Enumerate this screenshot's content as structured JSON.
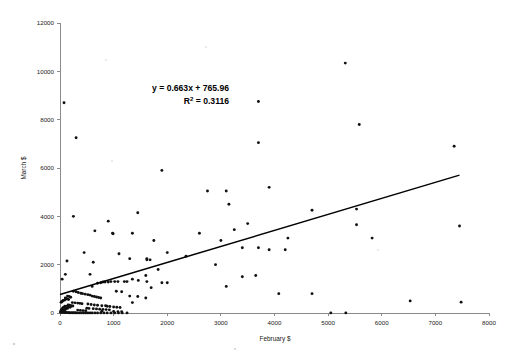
{
  "chart_data": {
    "type": "scatter",
    "title": "",
    "xlabel": "February $",
    "ylabel": "March $",
    "xlim": [
      0,
      8000
    ],
    "ylim": [
      0,
      12000
    ],
    "xticks": [
      0,
      1000,
      2000,
      3000,
      4000,
      5000,
      6000,
      7000,
      8000
    ],
    "yticks": [
      0,
      2000,
      4000,
      6000,
      8000,
      10000,
      12000
    ],
    "grid": false,
    "legend": "none",
    "marker": "small-black-dot",
    "annotations": [
      {
        "name": "regression-equation",
        "text": "y = 0.663x + 765.96"
      },
      {
        "name": "r-squared",
        "text_prefix": "R",
        "text_sup": "2",
        "text_suffix": " = 0.3116"
      }
    ],
    "trendline": {
      "type": "linear",
      "slope": 0.663,
      "intercept": 765.96,
      "r_squared": 0.3116,
      "x_start": 0,
      "x_end": 7450,
      "color": "#000000"
    },
    "series": [
      {
        "name": "Donors",
        "color": "#111111",
        "points": [
          [
            75,
            8700
          ],
          [
            300,
            7250
          ],
          [
            3700,
            8750
          ],
          [
            5320,
            10340
          ],
          [
            5580,
            7800
          ],
          [
            1900,
            5900
          ],
          [
            2750,
            5050
          ],
          [
            3100,
            5050
          ],
          [
            3700,
            7050
          ],
          [
            7350,
            6900
          ],
          [
            3900,
            5200
          ],
          [
            250,
            4000
          ],
          [
            1450,
            4150
          ],
          [
            900,
            3800
          ],
          [
            3150,
            4500
          ],
          [
            4700,
            4250
          ],
          [
            5530,
            4300
          ],
          [
            5530,
            3650
          ],
          [
            7450,
            3600
          ],
          [
            3500,
            3700
          ],
          [
            650,
            3400
          ],
          [
            980,
            3300
          ],
          [
            990,
            3280
          ],
          [
            1350,
            3300
          ],
          [
            1750,
            3000
          ],
          [
            2600,
            3300
          ],
          [
            3000,
            3000
          ],
          [
            4250,
            3100
          ],
          [
            3250,
            3450
          ],
          [
            5820,
            3100
          ],
          [
            3400,
            2700
          ],
          [
            3700,
            2700
          ],
          [
            3900,
            2620
          ],
          [
            4200,
            2620
          ],
          [
            450,
            2500
          ],
          [
            1100,
            2450
          ],
          [
            1300,
            2250
          ],
          [
            1620,
            2250
          ],
          [
            2000,
            2500
          ],
          [
            2350,
            2350
          ],
          [
            130,
            2150
          ],
          [
            620,
            2100
          ],
          [
            1620,
            2200
          ],
          [
            1680,
            2200
          ],
          [
            1830,
            1800
          ],
          [
            2900,
            2000
          ],
          [
            560,
            1600
          ],
          [
            100,
            1600
          ],
          [
            1600,
            1550
          ],
          [
            3400,
            1500
          ],
          [
            3650,
            1550
          ],
          [
            40,
            1400
          ],
          [
            1620,
            1300
          ],
          [
            1900,
            1250
          ],
          [
            2000,
            1250
          ],
          [
            3100,
            1100
          ],
          [
            1700,
            1050
          ],
          [
            1200,
            1300
          ],
          [
            1250,
            1300
          ],
          [
            1020,
            1300
          ],
          [
            1080,
            1300
          ],
          [
            900,
            1280
          ],
          [
            950,
            1300
          ],
          [
            800,
            1280
          ],
          [
            840,
            1280
          ],
          [
            760,
            1250
          ],
          [
            700,
            1230
          ],
          [
            600,
            1100
          ],
          [
            1600,
            620
          ],
          [
            1350,
            430
          ],
          [
            4080,
            800
          ],
          [
            4700,
            800
          ],
          [
            6530,
            500
          ],
          [
            7480,
            450
          ],
          [
            250,
            900
          ],
          [
            300,
            880
          ],
          [
            340,
            850
          ],
          [
            390,
            820
          ],
          [
            420,
            800
          ],
          [
            470,
            780
          ],
          [
            520,
            760
          ],
          [
            560,
            740
          ],
          [
            600,
            700
          ],
          [
            640,
            680
          ],
          [
            680,
            660
          ],
          [
            720,
            640
          ],
          [
            760,
            620
          ],
          [
            140,
            700
          ],
          [
            170,
            680
          ],
          [
            200,
            650
          ],
          [
            100,
            620
          ],
          [
            110,
            600
          ],
          [
            130,
            580
          ],
          [
            160,
            560
          ],
          [
            90,
            540
          ],
          [
            60,
            520
          ],
          [
            50,
            500
          ],
          [
            40,
            480
          ],
          [
            30,
            460
          ],
          [
            20,
            440
          ],
          [
            230,
            430
          ],
          [
            280,
            420
          ],
          [
            330,
            410
          ],
          [
            370,
            400
          ],
          [
            410,
            380
          ],
          [
            520,
            370
          ],
          [
            580,
            350
          ],
          [
            640,
            330
          ],
          [
            700,
            320
          ],
          [
            780,
            300
          ],
          [
            850,
            300
          ],
          [
            880,
            280
          ],
          [
            930,
            270
          ],
          [
            1000,
            250
          ],
          [
            1060,
            240
          ],
          [
            1120,
            230
          ],
          [
            620,
            180
          ],
          [
            680,
            170
          ],
          [
            740,
            160
          ],
          [
            800,
            150
          ],
          [
            860,
            140
          ],
          [
            920,
            130
          ],
          [
            330,
            120
          ],
          [
            380,
            110
          ],
          [
            430,
            100
          ],
          [
            480,
            90
          ],
          [
            150,
            330
          ],
          [
            180,
            320
          ],
          [
            210,
            300
          ],
          [
            240,
            290
          ],
          [
            90,
            280
          ],
          [
            110,
            270
          ],
          [
            130,
            260
          ],
          [
            160,
            250
          ],
          [
            190,
            240
          ],
          [
            60,
            230
          ],
          [
            80,
            220
          ],
          [
            100,
            210
          ],
          [
            120,
            200
          ],
          [
            140,
            190
          ],
          [
            40,
            180
          ],
          [
            55,
            170
          ],
          [
            70,
            160
          ],
          [
            85,
            150
          ],
          [
            100,
            140
          ],
          [
            25,
            130
          ],
          [
            35,
            120
          ],
          [
            45,
            110
          ],
          [
            55,
            100
          ],
          [
            65,
            90
          ],
          [
            15,
            80
          ],
          [
            25,
            70
          ],
          [
            35,
            60
          ],
          [
            45,
            50
          ],
          [
            55,
            40
          ],
          [
            10,
            35
          ],
          [
            20,
            30
          ],
          [
            30,
            25
          ],
          [
            70,
            20
          ],
          [
            90,
            20
          ],
          [
            110,
            18
          ],
          [
            130,
            15
          ],
          [
            150,
            15
          ],
          [
            170,
            12
          ],
          [
            200,
            10
          ],
          [
            230,
            10
          ],
          [
            260,
            8
          ],
          [
            290,
            8
          ],
          [
            320,
            5
          ],
          [
            360,
            5
          ],
          [
            400,
            5
          ],
          [
            440,
            5
          ],
          [
            480,
            5
          ],
          [
            520,
            5
          ],
          [
            560,
            5
          ],
          [
            600,
            5
          ],
          [
            650,
            5
          ],
          [
            700,
            5
          ],
          [
            760,
            5
          ],
          [
            820,
            5
          ],
          [
            880,
            5
          ],
          [
            950,
            5
          ],
          [
            1020,
            5
          ],
          [
            1090,
            5
          ],
          [
            1160,
            5
          ],
          [
            1250,
            5
          ],
          [
            5050,
            5
          ],
          [
            5330,
            5
          ],
          [
            1000,
            60
          ],
          [
            1080,
            55
          ],
          [
            1150,
            50
          ],
          [
            780,
            70
          ],
          [
            500,
            200
          ],
          [
            540,
            190
          ],
          [
            1300,
            700
          ],
          [
            1450,
            680
          ],
          [
            1050,
            900
          ],
          [
            1150,
            880
          ],
          [
            1350,
            1400
          ],
          [
            1460,
            1350
          ]
        ]
      }
    ]
  }
}
